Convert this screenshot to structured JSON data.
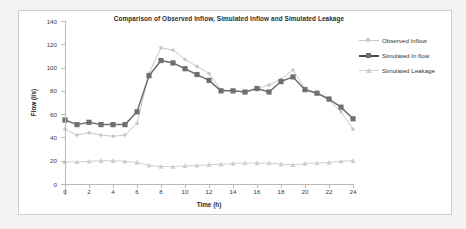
{
  "chart_data": {
    "type": "line",
    "title": "Comparison of Observed Inflow, Simulated Inflow and Simulated Leakage",
    "xlabel": "Time (h)",
    "ylabel": "Flow (l/s)",
    "xlim": [
      0,
      24
    ],
    "ylim": [
      0,
      140
    ],
    "xticks": [
      0,
      2,
      4,
      6,
      8,
      10,
      12,
      14,
      16,
      18,
      20,
      22,
      24
    ],
    "yticks": [
      0,
      20,
      40,
      60,
      80,
      100,
      120,
      140
    ],
    "grid": false,
    "legend_position": "right",
    "x": [
      0,
      1,
      2,
      3,
      4,
      5,
      6,
      7,
      8,
      9,
      10,
      11,
      12,
      13,
      14,
      15,
      16,
      17,
      18,
      19,
      20,
      21,
      22,
      23,
      24
    ],
    "series": [
      {
        "name": "Observed Inflow",
        "color": "#c8c8c8",
        "marker": "diamond",
        "values": [
          47,
          42,
          44,
          42,
          41,
          42,
          52,
          95,
          117,
          115,
          107,
          101,
          95,
          81,
          80,
          79,
          82,
          85,
          90,
          98,
          82,
          78,
          72,
          62,
          47
        ]
      },
      {
        "name": "Simulated In flow",
        "color": "#6f6f6f",
        "marker": "square",
        "values": [
          55,
          51,
          53,
          51,
          51,
          51,
          62,
          93,
          106,
          104,
          99,
          94,
          89,
          80,
          80,
          79,
          82,
          79,
          88,
          92,
          81,
          78,
          73,
          66,
          56
        ]
      },
      {
        "name": "Simulated Leakage",
        "color": "#cfcfcf",
        "marker": "triangle",
        "values": [
          19,
          19,
          19.5,
          20,
          20,
          19.5,
          18.5,
          16,
          15,
          15,
          15.5,
          16,
          16.5,
          17,
          17.5,
          18,
          18,
          18,
          17,
          16.5,
          17.5,
          18,
          18.5,
          19.5,
          20
        ]
      }
    ]
  },
  "axis": {
    "y_tick_labels": [
      "0",
      "20",
      "40",
      "60",
      "80",
      "100",
      "120",
      "140"
    ],
    "x_tick_labels": [
      "0",
      "2",
      "4",
      "6",
      "8",
      "10",
      "12",
      "14",
      "16",
      "18",
      "20",
      "22",
      "24"
    ]
  },
  "legend": {
    "items": [
      {
        "label": "Observed Inflow"
      },
      {
        "label": "Simulated In flow"
      },
      {
        "label": "Simulated Leakage"
      }
    ]
  }
}
